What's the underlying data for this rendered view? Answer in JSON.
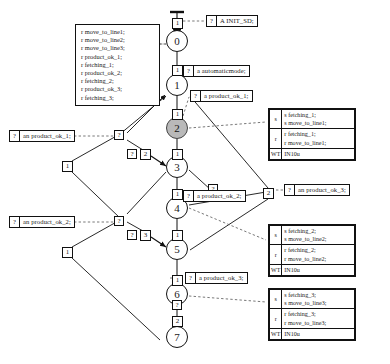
{
  "diagram": {
    "type": "petri-net-message-sequence",
    "title": "",
    "nodes": [
      {
        "id": "n0",
        "label": "0",
        "x": 167,
        "y": 41,
        "shaded": false
      },
      {
        "id": "n1",
        "label": "1",
        "x": 167,
        "y": 85,
        "shaded": false
      },
      {
        "id": "n2",
        "label": "2",
        "x": 167,
        "y": 128,
        "shaded": true
      },
      {
        "id": "n3",
        "label": "3",
        "x": 167,
        "y": 167,
        "shaded": false
      },
      {
        "id": "n4",
        "label": "4",
        "x": 167,
        "y": 208,
        "shaded": false
      },
      {
        "id": "n5",
        "label": "5",
        "x": 167,
        "y": 249,
        "shaded": false
      },
      {
        "id": "n6",
        "label": "6",
        "x": 167,
        "y": 294,
        "shaded": false
      },
      {
        "id": "n7",
        "label": "7",
        "x": 167,
        "y": 337,
        "shaded": false
      }
    ],
    "transitions": [
      {
        "id": "t_top",
        "label": "1",
        "x": 172,
        "y": 19
      },
      {
        "id": "t_0_1",
        "label": "1",
        "x": 172,
        "y": 66
      },
      {
        "id": "t_1_2",
        "label": "1",
        "x": 172,
        "y": 110
      },
      {
        "id": "t_2_3",
        "label": "1",
        "x": 172,
        "y": 150
      },
      {
        "id": "t_left_3",
        "label": "2",
        "x": 140,
        "y": 150
      },
      {
        "id": "t_3_4",
        "label": "1",
        "x": 172,
        "y": 190
      },
      {
        "id": "t_4_5",
        "label": "1",
        "x": 172,
        "y": 231
      },
      {
        "id": "t_left_5",
        "label": "3",
        "x": 140,
        "y": 231
      },
      {
        "id": "t_5_6",
        "label": "1",
        "x": 172,
        "y": 276
      },
      {
        "id": "t_6_7",
        "label": "2",
        "x": 172,
        "y": 317
      },
      {
        "id": "t_left_1",
        "label": "1",
        "x": 67,
        "y": 161
      },
      {
        "id": "t_left_2",
        "label": "1",
        "x": 67,
        "y": 247
      },
      {
        "id": "t_right_2",
        "label": "2",
        "x": 268,
        "y": 188
      }
    ],
    "qmarks": [
      {
        "id": "q_a",
        "label": "?",
        "x": 116,
        "y": 130
      },
      {
        "id": "q_b",
        "label": "?",
        "x": 116,
        "y": 216
      },
      {
        "id": "q_c",
        "label": "?",
        "x": 144,
        "y": 150
      },
      {
        "id": "q_d",
        "label": "?",
        "x": 144,
        "y": 231
      },
      {
        "id": "q_e",
        "label": "?",
        "x": 212,
        "y": 189
      },
      {
        "id": "q_f",
        "label": "?",
        "x": 172,
        "y": 318
      }
    ],
    "annotations": [
      {
        "id": "a_init",
        "q": "?",
        "text": "A INIT_SD;",
        "x": 206,
        "y": 15
      },
      {
        "id": "a_auto",
        "q": "?",
        "text": "a automaticmode;",
        "x": 183,
        "y": 70
      },
      {
        "id": "a_ok1r",
        "q": "?",
        "text": "a product_ok_1;",
        "x": 190,
        "y": 91
      },
      {
        "id": "a_ok1l",
        "q": "?",
        "text": "an product_ok_1;",
        "x": 9,
        "y": 130
      },
      {
        "id": "a_ok2r",
        "q": "?",
        "text": "a product_ok_2;",
        "x": 183,
        "y": 191
      },
      {
        "id": "a_ok2l",
        "q": "?",
        "text": "an product_ok_2;",
        "x": 9,
        "y": 216
      },
      {
        "id": "a_ok3r",
        "q": "?",
        "text": "an product_ok_3;",
        "x": 286,
        "y": 184
      },
      {
        "id": "a_ok3b",
        "q": "?",
        "text": "a product_ok_3;",
        "x": 158,
        "y": 273
      }
    ],
    "code_block": {
      "id": "code-left",
      "x": 75,
      "y": 24,
      "width": 85,
      "lines": [
        "r move_to_line1;",
        "r move_to_line2;",
        "r move_to_line3;",
        "r product_ok_1;",
        "r fetching_1;",
        "r product_ok_2;",
        "r fetching_2;",
        "r product_ok_3;",
        "r fetching_3;"
      ]
    },
    "side_tables": [
      {
        "id": "table-line1",
        "x": 268,
        "y": 108,
        "width": 88,
        "rows": [
          {
            "key": "s",
            "value": "s fetching_1;\ns move_to_line1;"
          },
          {
            "key": "r",
            "value": "r fetching_1;\nr move_to_line1;"
          },
          {
            "key": "WT",
            "value": "IN10u"
          }
        ]
      },
      {
        "id": "table-line2",
        "x": 268,
        "y": 224,
        "width": 88,
        "rows": [
          {
            "key": "s",
            "value": "s fetching_2;\ns move_to_line2;"
          },
          {
            "key": "r",
            "value": "r fetching_2;\nr move_to_line2;"
          },
          {
            "key": "WT",
            "value": "IN10u"
          }
        ]
      },
      {
        "id": "table-line3",
        "x": 268,
        "y": 288,
        "width": 88,
        "rows": [
          {
            "key": "s",
            "value": "s fetching_3;\ns move_to_line3;"
          },
          {
            "key": "r",
            "value": "r fetching_3;\nr move_to_line3;"
          },
          {
            "key": "WT",
            "value": "IN10u"
          }
        ]
      }
    ],
    "colors": {
      "stroke": "#111111",
      "background": "#ffffff",
      "shaded_node": "#b9b9b9",
      "dashed": "#555555"
    }
  }
}
